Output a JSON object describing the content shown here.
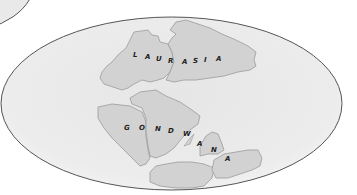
{
  "map": {
    "projection": "elliptical world map",
    "colors": {
      "background": "#ffffff",
      "ocean": "#ebebeb",
      "ocean_edge": "#f6f6f6",
      "land": "#d2d2d2",
      "land_outline": "#9a9a9a",
      "border": "#555555",
      "label": "#1e1e1e"
    },
    "landmasses": [
      {
        "name": "Laurasia",
        "label_letters": [
          "L",
          "A",
          "U",
          "R",
          "A",
          "S",
          "I",
          "A"
        ]
      },
      {
        "name": "Gondwana",
        "label_letters": [
          "G",
          "O",
          "N",
          "D",
          "W",
          "A",
          "N",
          "A"
        ]
      }
    ]
  }
}
